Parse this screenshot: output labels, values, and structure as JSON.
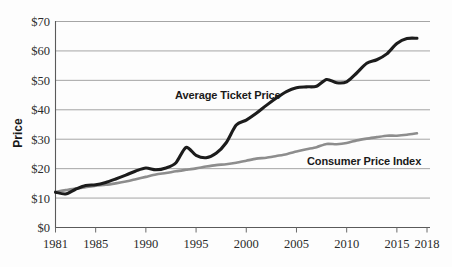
{
  "chart_data": {
    "type": "line",
    "title": "",
    "xlabel": "",
    "ylabel": "Price",
    "xlim": [
      1981,
      2018
    ],
    "ylim": [
      0,
      70
    ],
    "grid": true,
    "legend_position": "inline-annotation",
    "y_tick_labels": [
      "$0",
      "$10",
      "$20",
      "$30",
      "$40",
      "$50",
      "$60",
      "$70"
    ],
    "y_tick_values": [
      0,
      10,
      20,
      30,
      40,
      50,
      60,
      70
    ],
    "x_tick_labels": [
      "1981",
      "1985",
      "1990",
      "1995",
      "2000",
      "2005",
      "2010",
      "2015",
      "2018"
    ],
    "x_tick_values": [
      1981,
      1985,
      1990,
      1995,
      2000,
      2005,
      2010,
      2015,
      2018
    ],
    "x": [
      1981,
      1982,
      1983,
      1984,
      1985,
      1986,
      1987,
      1988,
      1989,
      1990,
      1991,
      1992,
      1993,
      1994,
      1995,
      1996,
      1997,
      1998,
      1999,
      2000,
      2001,
      2002,
      2003,
      2004,
      2005,
      2006,
      2007,
      2008,
      2009,
      2010,
      2011,
      2012,
      2013,
      2014,
      2015,
      2016,
      2017
    ],
    "series": [
      {
        "name": "Average Ticket Price",
        "color": "#1c1c1c",
        "values": [
          12.0,
          11.4,
          13.0,
          14.3,
          14.5,
          15.3,
          16.5,
          17.8,
          19.2,
          20.2,
          19.6,
          20.2,
          22.0,
          27.2,
          24.5,
          23.7,
          25.2,
          28.8,
          34.8,
          36.5,
          38.8,
          41.5,
          44.0,
          46.2,
          47.5,
          47.8,
          48.0,
          50.3,
          49.2,
          49.5,
          52.5,
          55.8,
          57.0,
          59.0,
          62.5,
          64.2,
          64.3
        ],
        "label_text": "Average Ticket Price"
      },
      {
        "name": "Consumer Price Index",
        "color": "#8d8d8d",
        "values": [
          12.0,
          12.7,
          13.2,
          13.7,
          14.2,
          14.5,
          15.0,
          15.6,
          16.4,
          17.2,
          18.0,
          18.5,
          19.1,
          19.6,
          20.1,
          20.7,
          21.2,
          21.5,
          22.0,
          22.7,
          23.4,
          23.7,
          24.3,
          24.9,
          25.8,
          26.6,
          27.3,
          28.4,
          28.3,
          28.7,
          29.6,
          30.2,
          30.7,
          31.2,
          31.2,
          31.5,
          32.0
        ],
        "label_text": "Consumer Price Index"
      }
    ]
  },
  "annotations": {
    "ticket_label": "Average Ticket Price",
    "cpi_label": "Consumer Price Index"
  },
  "axis": {
    "y_title": "Price"
  }
}
